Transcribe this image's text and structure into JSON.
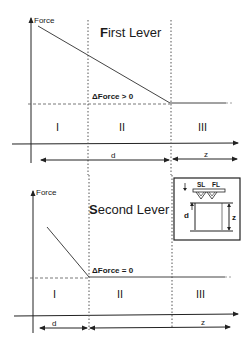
{
  "top_panel": {
    "title_first_letter": "F",
    "title_rest": "irst Lever",
    "y_axis_label": "Force",
    "delta_label": "ΔForce > 0",
    "regions": [
      "I",
      "II",
      "III"
    ],
    "dim_d": "d",
    "dim_z": "z"
  },
  "bottom_panel": {
    "title_first_letter": "S",
    "title_rest": "econd Lever",
    "y_axis_label": "Force",
    "delta_label": "ΔForce = 0",
    "regions": [
      "I",
      "II",
      "III"
    ],
    "dim_d": "d",
    "dim_z": "z"
  },
  "inset": {
    "label_sl": "SL",
    "label_fl": "FL",
    "label_d": "d",
    "label_z": "z"
  },
  "colors": {
    "line": "#333333",
    "dotted": "#555555",
    "text": "#1a1a1a"
  }
}
